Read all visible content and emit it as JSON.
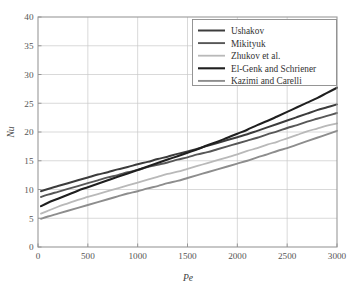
{
  "chart_data": {
    "type": "line",
    "title": "",
    "xlabel": "Pe",
    "ylabel": "Nu",
    "xlim": [
      0,
      3000
    ],
    "ylim": [
      0,
      40
    ],
    "xticks": [
      0,
      500,
      1000,
      1500,
      2000,
      2500,
      3000
    ],
    "xtick_labels": [
      "0",
      "500",
      "1000",
      "1500",
      "2000",
      "2500",
      "3000"
    ],
    "yticks": [
      0,
      5,
      10,
      15,
      20,
      25,
      30,
      35,
      40
    ],
    "ytick_labels": [
      "0",
      "5",
      "10",
      "15",
      "20",
      "25",
      "30",
      "35",
      "40"
    ],
    "grid": true,
    "legend_position": "upper right",
    "x": [
      30,
      100,
      200,
      300,
      400,
      500,
      600,
      700,
      800,
      900,
      1000,
      1100,
      1200,
      1300,
      1400,
      1500,
      1600,
      1700,
      1800,
      1900,
      2000,
      2100,
      2200,
      2300,
      2400,
      2500,
      2600,
      2700,
      2800,
      2900,
      3000
    ],
    "series": [
      {
        "name": "Ushakov",
        "color": "#3c3c3c",
        "linewidth": 2.0,
        "values": [
          9.7,
          10.1,
          10.6,
          11.1,
          11.6,
          12.1,
          12.6,
          13.0,
          13.5,
          13.9,
          14.4,
          14.8,
          15.3,
          15.7,
          16.2,
          16.6,
          17.1,
          17.6,
          18.1,
          18.6,
          19.1,
          19.6,
          20.2,
          20.8,
          21.4,
          22.0,
          22.6,
          23.2,
          23.8,
          24.3,
          24.8
        ]
      },
      {
        "name": "Mikityuk",
        "color": "#575757",
        "linewidth": 1.9,
        "values": [
          8.7,
          9.1,
          9.6,
          10.1,
          10.6,
          11.1,
          11.6,
          12.1,
          12.5,
          13.0,
          13.4,
          13.9,
          14.3,
          14.7,
          15.2,
          15.6,
          16.1,
          16.5,
          17.0,
          17.5,
          18.0,
          18.5,
          19.0,
          19.6,
          20.1,
          20.7,
          21.2,
          21.8,
          22.3,
          22.8,
          23.3
        ]
      },
      {
        "name": "Zhukov et al.",
        "color": "#b9b9b9",
        "linewidth": 1.8,
        "values": [
          5.8,
          6.3,
          7.0,
          7.6,
          8.2,
          8.7,
          9.2,
          9.7,
          10.2,
          10.7,
          11.2,
          11.7,
          12.2,
          12.7,
          13.1,
          13.6,
          14.1,
          14.6,
          15.1,
          15.6,
          16.1,
          16.7,
          17.2,
          17.8,
          18.3,
          18.9,
          19.5,
          20.1,
          20.6,
          21.1,
          21.5
        ]
      },
      {
        "name": "El-Genk and Schriener",
        "color": "#1f1f1f",
        "linewidth": 2.1,
        "values": [
          7.1,
          7.7,
          8.4,
          9.1,
          9.8,
          10.4,
          11.0,
          11.6,
          12.2,
          12.8,
          13.4,
          14.0,
          14.6,
          15.2,
          15.8,
          16.4,
          17.0,
          17.7,
          18.3,
          19.0,
          19.7,
          20.4,
          21.2,
          21.9,
          22.7,
          23.5,
          24.3,
          25.1,
          25.9,
          26.8,
          27.7
        ]
      },
      {
        "name": "Kazimi and Carelli",
        "color": "#8d8d8d",
        "linewidth": 1.9,
        "values": [
          4.9,
          5.3,
          5.8,
          6.3,
          6.8,
          7.3,
          7.8,
          8.3,
          8.8,
          9.3,
          9.7,
          10.2,
          10.6,
          11.1,
          11.5,
          12.0,
          12.5,
          13.0,
          13.5,
          14.0,
          14.5,
          15.0,
          15.6,
          16.1,
          16.7,
          17.2,
          17.8,
          18.4,
          19.0,
          19.6,
          20.2
        ]
      }
    ]
  },
  "legend": {
    "entries": [
      {
        "label": "Ushakov"
      },
      {
        "label": "Mikityuk"
      },
      {
        "label": "Zhukov et al."
      },
      {
        "label": "El-Genk and Schriener"
      },
      {
        "label": "Kazimi and Carelli"
      }
    ]
  },
  "axes": {
    "x_title": "Pe",
    "y_title": "Nu"
  }
}
